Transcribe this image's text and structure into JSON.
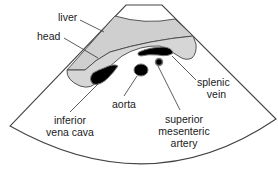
{
  "colors": {
    "outline": "#444444",
    "liver_fill": "#cfcfcf",
    "pancreas_fill": "#d6d6d6",
    "vessel_fill": "#000000",
    "background": "#ffffff"
  },
  "labels": {
    "liver": "liver",
    "head": "head",
    "splenic_vein_1": "splenic",
    "splenic_vein_2": "vein",
    "ivc_1": "inferior",
    "ivc_2": "vena cava",
    "aorta": "aorta",
    "sma_1": "superior",
    "sma_2": "mesenteric",
    "sma_3": "artery"
  }
}
